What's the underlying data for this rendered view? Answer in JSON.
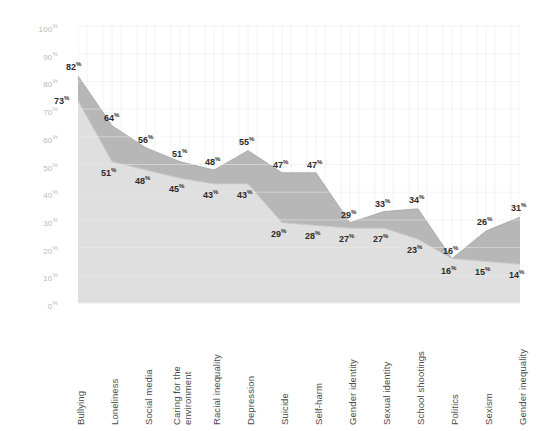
{
  "chart_data": {
    "type": "area",
    "title": "",
    "xlabel": "",
    "ylabel": "",
    "ylim": [
      0,
      100
    ],
    "grid": true,
    "legend": "none",
    "categories": [
      "Bullying",
      "Loneliness",
      "Social media",
      "Caring for the environment",
      "Racial inequality",
      "Depression",
      "Suicide",
      "Self-harm",
      "Gender identity",
      "Sexual identity",
      "School shootings",
      "Politics",
      "Sexism",
      "Gender inequality"
    ],
    "yticks": [
      "0%",
      "10%",
      "20%",
      "30%",
      "40%",
      "50%",
      "60%",
      "70%",
      "80%",
      "90%",
      "100%"
    ],
    "ytick_values": [
      0,
      10,
      20,
      30,
      40,
      50,
      60,
      70,
      80,
      90,
      100
    ],
    "series": [
      {
        "name": "Series 1",
        "color": "#b3b3b3",
        "values": [
          82,
          64,
          56,
          51,
          48,
          55,
          47,
          47,
          29,
          33,
          34,
          16,
          26,
          31
        ],
        "labels": [
          "82%",
          "64%",
          "56%",
          "51%",
          "48%",
          "55%",
          "47%",
          "47%",
          "29%",
          "33%",
          "34%",
          "16%",
          "26%",
          "31%"
        ]
      },
      {
        "name": "Series 2",
        "color": "#d9d9d9",
        "values": [
          73,
          51,
          48,
          45,
          43,
          43,
          29,
          28,
          27,
          27,
          23,
          16,
          15,
          14
        ],
        "labels": [
          "73%",
          "51%",
          "48%",
          "45%",
          "43%",
          "43%",
          "29%",
          "28%",
          "27%",
          "27%",
          "23%",
          "16%",
          "15%",
          "14%"
        ]
      }
    ]
  },
  "colors": {
    "background": "#ffffff",
    "axis_text": "#b9b9b9",
    "category_text": "#4b4b4b",
    "data_label_text": "#2b2b2b",
    "series1_fill": "#b3b3b3",
    "series2_fill": "#e2e2e2",
    "gridline": "#ececec"
  }
}
